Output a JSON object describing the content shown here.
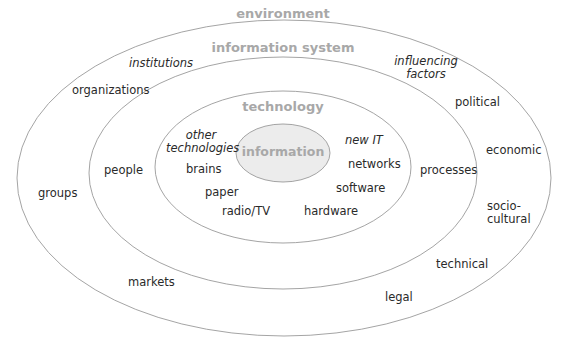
{
  "diagram": {
    "layers": {
      "environment": {
        "title": "environment",
        "items": [
          "institutions",
          "organizations",
          "groups",
          "markets",
          "influencing factors",
          "political",
          "economic",
          "socio-cultural",
          "technical",
          "legal"
        ]
      },
      "information_system": {
        "title": "information system",
        "items": [
          "people",
          "processes"
        ]
      },
      "technology": {
        "title": "technology",
        "items": [
          "other technologies",
          "brains",
          "paper",
          "radio/TV",
          "new IT",
          "networks",
          "software",
          "hardware"
        ]
      },
      "information": {
        "title": "information"
      }
    },
    "labels": {
      "institutions": "institutions",
      "organizations": "organizations",
      "groups": "groups",
      "markets": "markets",
      "influencing_1": "influencing",
      "influencing_2": "factors",
      "political": "political",
      "economic": "economic",
      "socio_1": "socio-",
      "socio_2": "cultural",
      "technical": "technical",
      "legal": "legal",
      "people": "people",
      "processes": "processes",
      "other_1": "other",
      "other_2": "technologies",
      "brains": "brains",
      "paper": "paper",
      "radio_tv": "radio/TV",
      "new_it": "new IT",
      "networks": "networks",
      "software": "software",
      "hardware": "hardware"
    },
    "colors": {
      "ring_stroke": "#9a9a9a",
      "header_text": "#a8a8a8",
      "info_fill": "#ececec",
      "label_text": "#2a2a2a"
    }
  }
}
